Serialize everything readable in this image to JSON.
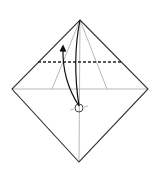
{
  "diagram": {
    "type": "origami-fold-step",
    "colors": {
      "background": "#ffffff",
      "outline": "#333333",
      "crease": "#b0b0b0",
      "fold_line": "#222222",
      "arrow": "#111111"
    },
    "paper": {
      "shape": "diamond",
      "top": [
        80,
        20
      ],
      "right": [
        148,
        89
      ],
      "bottom": [
        79,
        162
      ],
      "left": [
        12,
        89
      ]
    },
    "valley_fold_line": {
      "y": 62,
      "x1": 38,
      "x2": 121,
      "style": "dashed"
    },
    "reference_point": {
      "cx": 79,
      "cy": 108,
      "r": 4
    },
    "fold_arrow": {
      "from": [
        79,
        106
      ],
      "to": [
        63,
        46
      ],
      "direction": "up"
    }
  }
}
